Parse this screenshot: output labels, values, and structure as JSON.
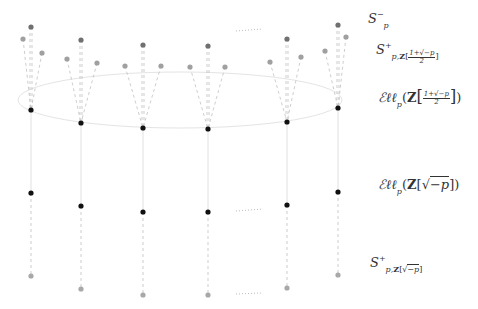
{
  "diagram": {
    "colors": {
      "background": "#ffffff",
      "top_node": "#707070",
      "side_node": "#a0a0a0",
      "black_node": "#111111",
      "bottom_node": "#a8a8a8",
      "dashed_line": "#c0c0c0",
      "solid_line": "#e0e0e0",
      "ellipse": "#e4e4e4",
      "dots": "#bbbbbb"
    },
    "ellipse": {
      "cx": 180,
      "cy": 100,
      "rx": 162,
      "ry": 28
    },
    "columns": [
      {
        "x": 31,
        "top_y": 27,
        "side": [
          [
            23,
            39
          ],
          [
            42,
            53
          ]
        ],
        "black_y": 110,
        "mid_y": 193,
        "bottom_y": 276
      },
      {
        "x": 81,
        "top_y": 40,
        "side": [
          [
            67,
            59
          ],
          [
            97,
            63
          ]
        ],
        "black_y": 123,
        "mid_y": 206,
        "bottom_y": 289
      },
      {
        "x": 143,
        "top_y": 45,
        "side": [
          [
            125,
            66
          ],
          [
            161,
            66
          ]
        ],
        "black_y": 128,
        "mid_y": 212,
        "bottom_y": 295
      },
      {
        "x": 208,
        "top_y": 46,
        "side": [
          [
            190,
            67
          ],
          [
            225,
            67
          ]
        ],
        "black_y": 129,
        "mid_y": 212,
        "bottom_y": 295
      },
      {
        "x": 287,
        "top_y": 39,
        "side": [
          [
            270,
            62
          ],
          [
            301,
            57
          ]
        ],
        "black_y": 122,
        "mid_y": 205,
        "bottom_y": 288
      },
      {
        "x": 338,
        "top_y": 25,
        "side": [
          [
            325,
            51
          ],
          [
            346,
            37
          ]
        ],
        "black_y": 108,
        "mid_y": 192,
        "bottom_y": 275
      }
    ],
    "ellipsis_marks": [
      {
        "x1": 236,
        "y1": 31,
        "x2": 262,
        "y2": 29
      },
      {
        "x1": 236,
        "y1": 211,
        "x2": 263,
        "y2": 209
      },
      {
        "x1": 236,
        "y1": 294,
        "x2": 262,
        "y2": 293
      }
    ]
  },
  "labels": {
    "s_p_minus": {
      "base": "S",
      "sub": "p",
      "sup": "−"
    },
    "s_plus_half": {
      "base": "S",
      "sup": "+",
      "sub_prefix": "p,",
      "ring": "Z",
      "open": "[",
      "num": "1+√−p",
      "den": "2",
      "close": "]"
    },
    "ell_half": {
      "script": "ℰℓℓ",
      "sub": "p",
      "open_paren": "(",
      "ring": "Z",
      "open": "[",
      "num": "1+√−p",
      "den": "2",
      "close": "]",
      "close_paren": ")"
    },
    "ell_sqrt": {
      "script": "ℰℓℓ",
      "sub": "p",
      "open_paren": "(",
      "ring": "Z",
      "open": "[",
      "sqrt": "√",
      "radicand": "−p",
      "close": "]",
      "close_paren": ")"
    },
    "s_plus_sqrt": {
      "base": "S",
      "sup": "+",
      "sub_prefix": "p,",
      "ring": "Z",
      "open": "[",
      "sqrt": "√",
      "radicand": "−p",
      "close": "]"
    }
  }
}
